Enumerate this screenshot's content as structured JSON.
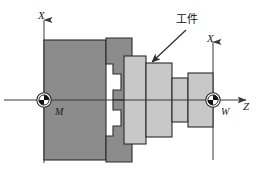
{
  "figure": {
    "type": "technical-diagram",
    "background_color": "#ffffff",
    "outline_color": "#2b2b2b",
    "chuck_color": "#8c8c8c",
    "workpiece_color": "#c8c8c8",
    "axis_color": "#3a3a3a"
  },
  "labels": {
    "axis_x_left": "X",
    "axis_x_right": "X",
    "axis_z": "Z",
    "machine_origin": "M",
    "workpiece_origin": "W",
    "workpiece_callout": "工件"
  },
  "markers": {
    "machine_origin_symbol": "origin-circle-quadrant",
    "workpiece_origin_symbol": "origin-circle-quadrant"
  },
  "geometry": {
    "centerline_y": 100,
    "chuck_body": {
      "x": 44,
      "y": 40,
      "w": 62,
      "h": 120
    },
    "jaw_upper": {
      "x": 106,
      "y": 38,
      "w": 26,
      "h": 62
    },
    "jaw_lower": {
      "x": 106,
      "y": 100,
      "w": 26,
      "h": 62
    },
    "flange": {
      "x": 124,
      "y": 56,
      "w": 22,
      "h": 88
    },
    "stage_large": {
      "x": 146,
      "y": 63,
      "w": 26,
      "h": 74
    },
    "stage_mid": {
      "x": 172,
      "y": 78,
      "w": 16,
      "h": 44
    },
    "stage_end": {
      "x": 188,
      "y": 73,
      "w": 25,
      "h": 54
    }
  }
}
